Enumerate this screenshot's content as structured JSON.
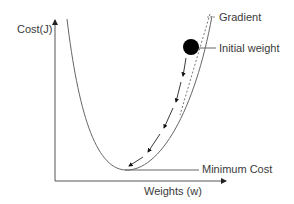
{
  "diagram": {
    "y_axis_label": "Cost(J)",
    "x_axis_label": "Weights (w)",
    "annotations": {
      "gradient": "Gradient",
      "initial_weight": "Initial weight",
      "minimum_cost": "Minimum Cost"
    },
    "colors": {
      "line": "#555555",
      "ball": "#000000",
      "text": "#3a3a3a"
    },
    "descent_arrows": 5
  }
}
